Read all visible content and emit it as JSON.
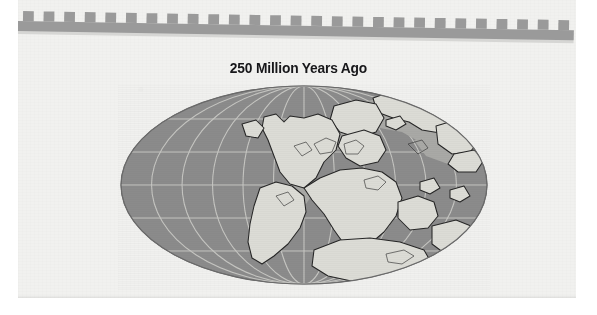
{
  "page": {
    "title": "250 Million Years Ago",
    "background_color": "#f1f1ef",
    "paper_edge_color": "#ffffff"
  },
  "ornament": {
    "name": "crenellated-border-band",
    "tooth_count": 27,
    "color": "#9a9a9a",
    "shadow_color": "#d6d6d4"
  },
  "map": {
    "projection": "mollweide-elliptical",
    "ocean_color": "#8b8b8b",
    "land_color": "#dcdcd6",
    "shelf_color": "#a8a8a6",
    "coastline_color": "#2b2b2b",
    "graticule_color": "#c9c9c5",
    "graticule_latitude_step_deg": 30,
    "graticule_longitude_step_deg": 30,
    "landmasses": [
      "Laurasia",
      "Gondwana",
      "Siberia",
      "North America",
      "South America",
      "Africa",
      "India",
      "Antarctica",
      "Australia",
      "Europe",
      "North China",
      "South China"
    ],
    "supercontinent": "Pangaea",
    "ellipse": {
      "center_x": 186,
      "center_y": 101,
      "radius_x": 183,
      "radius_y": 99
    }
  },
  "chart_data": {
    "type": "map",
    "title": "250 Million Years Ago",
    "subtitle": "",
    "legend": [],
    "annotations": [],
    "age_value": 250,
    "age_unit": "Million Years Ago"
  }
}
